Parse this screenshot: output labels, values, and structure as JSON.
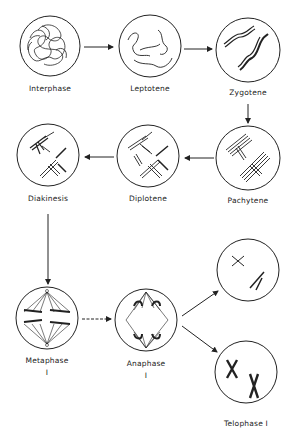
{
  "diagram": {
    "stages": [
      {
        "id": "interphase",
        "label": "Interphase"
      },
      {
        "id": "leptotene",
        "label": "Leptotene"
      },
      {
        "id": "zygotene",
        "label": "Zygotene"
      },
      {
        "id": "pachytene",
        "label": "Pachytene"
      },
      {
        "id": "diplotene",
        "label": "Diplotene"
      },
      {
        "id": "diakinesis",
        "label": "Diakinesis"
      },
      {
        "id": "metaphase1",
        "label": "Metaphase",
        "sublabel": "I"
      },
      {
        "id": "anaphase1",
        "label": "Anaphase",
        "sublabel": "I"
      },
      {
        "id": "telophase1",
        "label": "Telophase I"
      }
    ],
    "edges": [
      [
        "interphase",
        "leptotene"
      ],
      [
        "leptotene",
        "zygotene"
      ],
      [
        "zygotene",
        "pachytene"
      ],
      [
        "pachytene",
        "diplotene"
      ],
      [
        "diplotene",
        "diakinesis"
      ],
      [
        "diakinesis",
        "metaphase1"
      ],
      [
        "metaphase1",
        "anaphase1"
      ],
      [
        "anaphase1",
        "telophase1-upper"
      ],
      [
        "anaphase1",
        "telophase1-lower"
      ]
    ]
  }
}
